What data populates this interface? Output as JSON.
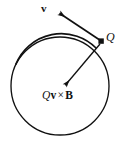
{
  "figure": {
    "type": "physics-diagram",
    "background_color": "#ffffff",
    "stroke_color": "#111111",
    "circle": {
      "name": "circular-path",
      "center_x": 60,
      "center_y": 86,
      "radius": 49,
      "stroke_width": 1.4,
      "fill": "none"
    },
    "point_charge": {
      "name": "charge-marker",
      "x": 101,
      "y": 41,
      "size": 5,
      "shape": "square"
    },
    "vectors": [
      {
        "name": "velocity-vector",
        "label": "v",
        "label_style": "bold",
        "from_x": 101,
        "from_y": 41,
        "to_x": 58,
        "to_y": 12,
        "stroke_width": 1.6
      },
      {
        "name": "magnetic-force-vector",
        "label": "Qv × B",
        "label_style": "mixed-italic-bold",
        "from_x": 100,
        "from_y": 44,
        "to_x": 63,
        "to_y": 87,
        "stroke_width": 1.3
      }
    ],
    "labels": {
      "velocity": "v",
      "charge": "Q",
      "force_charge": "Q",
      "force_velocity": "v",
      "force_operator": "×",
      "force_field": "B",
      "force_full": "Qv × B"
    }
  }
}
